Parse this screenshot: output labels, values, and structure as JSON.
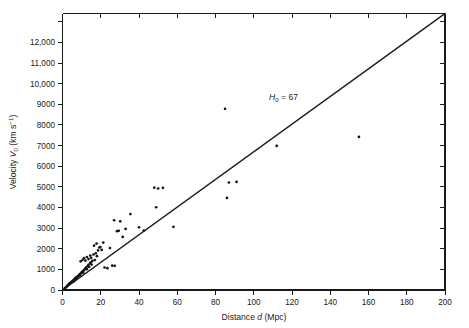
{
  "chart_data": {
    "type": "scatter",
    "title": "",
    "xlabel": "Distance d (Mpc)",
    "ylabel": "Velocity V0 (km s-1)",
    "xlabel_parts": {
      "prefix": "Distance ",
      "italic": "d",
      "suffix": " (Mpc)"
    },
    "ylabel_parts": {
      "prefix": "Velocity ",
      "italic": "V",
      "sub": "0",
      "suffix": " (km s",
      "sup": "−1",
      "tail": ")"
    },
    "xlim": [
      0,
      200
    ],
    "ylim": [
      0,
      13400
    ],
    "grid": false,
    "legend": null,
    "xticks": [
      0,
      20,
      40,
      60,
      80,
      100,
      120,
      140,
      160,
      180,
      200
    ],
    "xticklabels": [
      "0",
      "20",
      "40",
      "60",
      "80",
      "100",
      "120",
      "140",
      "160",
      "180",
      "200"
    ],
    "yticks": [
      0,
      1000,
      2000,
      3000,
      4000,
      5000,
      6000,
      7000,
      8000,
      9000,
      10000,
      11000,
      12000,
      13000
    ],
    "yticklabels": [
      "0",
      "1000",
      "2000",
      "3000",
      "4000",
      "5000",
      "6000",
      "7000",
      "8000",
      "9000",
      "10,000",
      "11,000",
      "12,000",
      ""
    ],
    "annotations": [
      {
        "name": "hubble-constant-label",
        "text": "H0 = 67",
        "italic": "H",
        "sub": "0",
        "rest": " = 67",
        "x": 108,
        "y": 9200
      }
    ],
    "fit_line": {
      "name": "hubble-law-fit",
      "slope": 67,
      "intercept": 0,
      "x_start": 0,
      "y_start": 0,
      "x_end": 200,
      "y_end": 13400
    },
    "points": [
      [
        1.2,
        90
      ],
      [
        1.8,
        130
      ],
      [
        2.2,
        170
      ],
      [
        2.6,
        210
      ],
      [
        3.0,
        240
      ],
      [
        3.3,
        290
      ],
      [
        3.7,
        300
      ],
      [
        4.0,
        340
      ],
      [
        4.4,
        360
      ],
      [
        4.8,
        400
      ],
      [
        5.2,
        430
      ],
      [
        5.6,
        470
      ],
      [
        5.9,
        430
      ],
      [
        6.2,
        520
      ],
      [
        6.6,
        560
      ],
      [
        7.0,
        600
      ],
      [
        7.3,
        560
      ],
      [
        7.7,
        640
      ],
      [
        8.1,
        670
      ],
      [
        8.5,
        700
      ],
      [
        8.9,
        760
      ],
      [
        9.2,
        720
      ],
      [
        9.6,
        810
      ],
      [
        10.0,
        860
      ],
      [
        10.4,
        900
      ],
      [
        10.8,
        840
      ],
      [
        11.1,
        940
      ],
      [
        11.5,
        990
      ],
      [
        11.9,
        1040
      ],
      [
        12.3,
        1080
      ],
      [
        12.7,
        1010
      ],
      [
        13.1,
        1150
      ],
      [
        13.5,
        1210
      ],
      [
        13.9,
        1120
      ],
      [
        14.3,
        1290
      ],
      [
        14.8,
        1340
      ],
      [
        15.2,
        1230
      ],
      [
        15.6,
        1410
      ],
      [
        9.5,
        1390
      ],
      [
        10.5,
        1460
      ],
      [
        11.3,
        1540
      ],
      [
        12.0,
        1420
      ],
      [
        12.8,
        1600
      ],
      [
        13.6,
        1500
      ],
      [
        14.5,
        1670
      ],
      [
        15.0,
        1560
      ],
      [
        16.2,
        1720
      ],
      [
        16.9,
        1450
      ],
      [
        17.4,
        1780
      ],
      [
        18.0,
        1640
      ],
      [
        18.6,
        1920
      ],
      [
        19.2,
        2060
      ],
      [
        16.5,
        2150
      ],
      [
        17.8,
        2250
      ],
      [
        19.8,
        2080
      ],
      [
        20.5,
        1940
      ],
      [
        21.3,
        2300
      ],
      [
        22.0,
        1090
      ],
      [
        23.5,
        1060
      ],
      [
        24.8,
        2030
      ],
      [
        26.0,
        1180
      ],
      [
        27.3,
        1170
      ],
      [
        28.5,
        2850
      ],
      [
        29.4,
        2870
      ],
      [
        27.0,
        3380
      ],
      [
        30.2,
        3330
      ],
      [
        31.5,
        2570
      ],
      [
        33.0,
        2960
      ],
      [
        35.5,
        3680
      ],
      [
        40.0,
        3040
      ],
      [
        42.5,
        2880
      ],
      [
        48.0,
        4960
      ],
      [
        50.0,
        4920
      ],
      [
        49.0,
        4010
      ],
      [
        52.5,
        4950
      ],
      [
        58.0,
        3060
      ],
      [
        85.0,
        8780
      ],
      [
        87.0,
        5210
      ],
      [
        91.0,
        5240
      ],
      [
        86.0,
        4460
      ],
      [
        112.0,
        6980
      ],
      [
        155.0,
        7420
      ]
    ]
  }
}
